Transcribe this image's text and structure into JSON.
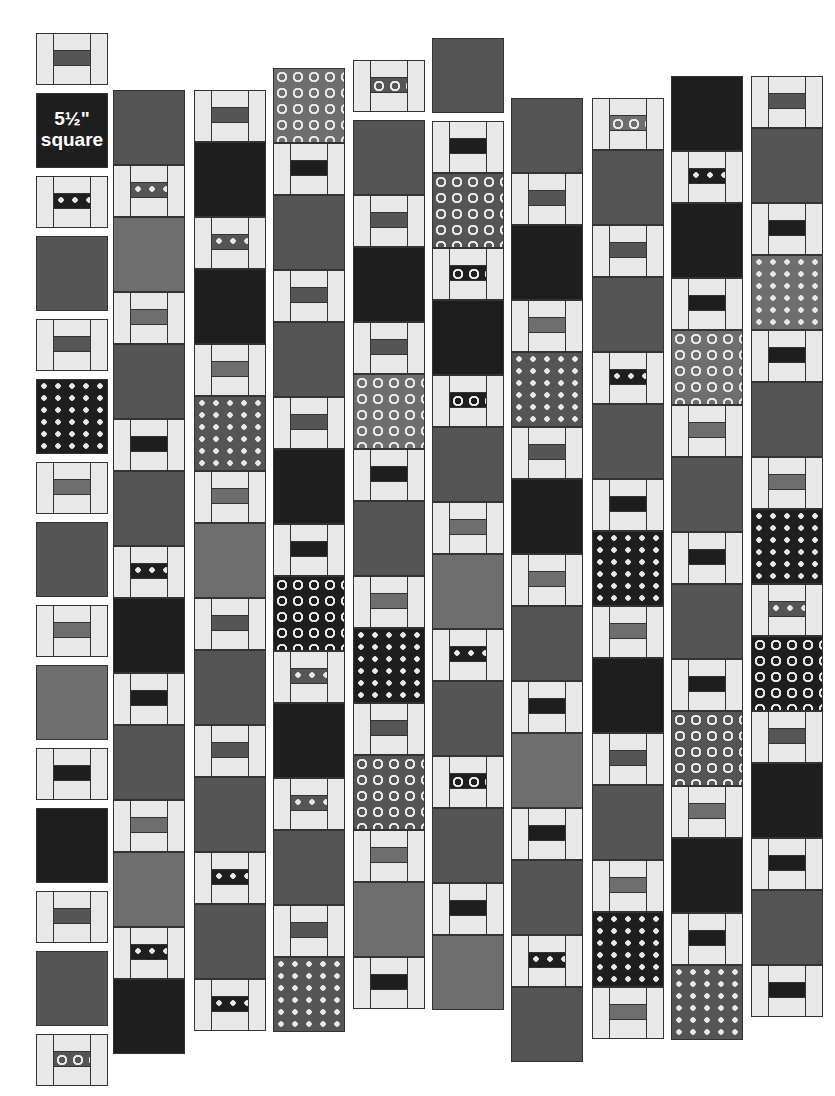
{
  "diagram": {
    "label_block": {
      "line1": "5½\"",
      "line2": "square"
    },
    "colors": {
      "background": "#ffffff",
      "outline": "#333333",
      "frame_light": "#e8e8e8",
      "dark": "#1e1e1e",
      "medium": "#555555",
      "light_gray": "#6e6e6e"
    },
    "columns": [
      {
        "x": 36,
        "y": 33,
        "items": [
          "fr:medium",
          "gap",
          "sq:dark:label",
          "gap",
          "fr:dark-stars",
          "gap",
          "sq:medium",
          "gap",
          "fr:medium",
          "gap",
          "sq:dark-stars",
          "gap",
          "fr:light_gray",
          "gap",
          "sq:medium",
          "gap",
          "fr:light_gray",
          "gap",
          "sq:light_gray",
          "gap",
          "fr:dark",
          "gap",
          "sq:dark",
          "gap",
          "fr:medium",
          "gap",
          "sq:medium",
          "gap",
          "fr:medium-dots"
        ]
      },
      {
        "x": 113,
        "y": 90,
        "items": [
          "sq:medium",
          "fr:medium-stars",
          "sq:light_gray",
          "fr:light_gray",
          "sq:medium",
          "fr:dark",
          "sq:medium",
          "fr:dark-stars",
          "sq:dark",
          "fr:dark",
          "sq:medium",
          "fr:light_gray",
          "sq:light_gray",
          "fr:dark-stars",
          "sq:dark"
        ]
      },
      {
        "x": 194,
        "y": 90,
        "items": [
          "fr:medium",
          "sq:dark",
          "fr:medium-stars",
          "sq:dark",
          "fr:light_gray",
          "sq:medium-stars",
          "fr:light_gray",
          "sq:light_gray",
          "fr:medium",
          "sq:medium",
          "fr:medium",
          "sq:medium",
          "fr:dark-stars",
          "sq:medium",
          "fr:dark-stars"
        ]
      },
      {
        "x": 273,
        "y": 68,
        "items": [
          "sq:light_gray-dots",
          "fr:dark",
          "sq:medium",
          "fr:medium",
          "sq:medium",
          "fr:medium",
          "sq:dark",
          "fr:dark",
          "sq:dark-dots",
          "fr:medium-stars",
          "sq:dark",
          "fr:medium-stars",
          "sq:medium",
          "fr:medium",
          "sq:medium-stars"
        ]
      },
      {
        "x": 353,
        "y": 60,
        "items": [
          "fr:medium-dots",
          "gap",
          "sq:medium",
          "fr:medium",
          "sq:dark",
          "fr:medium",
          "sq:light_gray-dots",
          "fr:dark",
          "sq:medium",
          "fr:light_gray",
          "sq:dark-stars",
          "fr:medium",
          "sq:medium-dots",
          "fr:light_gray",
          "sq:light_gray",
          "fr:dark"
        ]
      },
      {
        "x": 432,
        "y": 38,
        "items": [
          "sq:medium",
          "gap",
          "fr:dark",
          "sq:medium-dots",
          "fr:dark-dots",
          "sq:dark",
          "fr:dark-dots",
          "sq:medium",
          "fr:light_gray",
          "sq:light_gray",
          "fr:dark-stars",
          "sq:medium",
          "fr:dark-dots",
          "sq:medium",
          "fr:dark",
          "sq:light_gray"
        ]
      },
      {
        "x": 511,
        "y": 98,
        "items": [
          "sq:medium",
          "fr:medium",
          "sq:dark",
          "fr:light_gray",
          "sq:medium-stars",
          "fr:medium",
          "sq:dark",
          "fr:light_gray",
          "sq:medium",
          "fr:dark",
          "sq:light_gray",
          "fr:dark",
          "sq:medium",
          "fr:dark-stars",
          "sq:medium"
        ]
      },
      {
        "x": 592,
        "y": 98,
        "items": [
          "fr:light_gray-dots",
          "sq:medium",
          "fr:medium",
          "sq:medium",
          "fr:dark-stars",
          "sq:medium",
          "fr:dark",
          "sq:dark-stars",
          "fr:light_gray",
          "sq:dark",
          "fr:medium",
          "sq:medium",
          "fr:light_gray",
          "sq:dark-stars",
          "fr:light_gray"
        ]
      },
      {
        "x": 671,
        "y": 76,
        "items": [
          "sq:dark",
          "fr:dark-stars",
          "sq:dark",
          "fr:dark",
          "sq:light_gray-dots",
          "fr:light_gray",
          "sq:medium",
          "fr:dark",
          "sq:medium",
          "fr:dark",
          "sq:medium-dots",
          "fr:light_gray",
          "sq:dark",
          "fr:dark",
          "sq:medium-stars"
        ]
      },
      {
        "x": 751,
        "y": 76,
        "items": [
          "fr:medium",
          "sq:medium",
          "fr:dark",
          "sq:light_gray-stars",
          "fr:dark",
          "sq:medium",
          "fr:light_gray",
          "sq:dark-stars",
          "fr:medium-stars",
          "sq:dark-dots",
          "fr:medium",
          "sq:dark",
          "fr:dark",
          "sq:medium",
          "fr:dark"
        ]
      }
    ]
  }
}
